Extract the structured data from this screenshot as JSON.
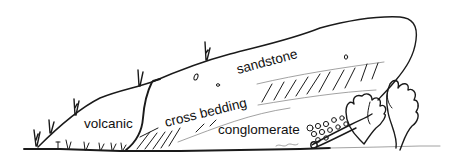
{
  "diagram": {
    "type": "geological-sketch",
    "labels": {
      "volcanic": "volcanic",
      "cross_bedding": "cross bedding",
      "sandstone": "sandstone",
      "conglomerate": "conglomerate"
    },
    "colors": {
      "ink": "#1a1a1a",
      "background": "#ffffff"
    }
  }
}
